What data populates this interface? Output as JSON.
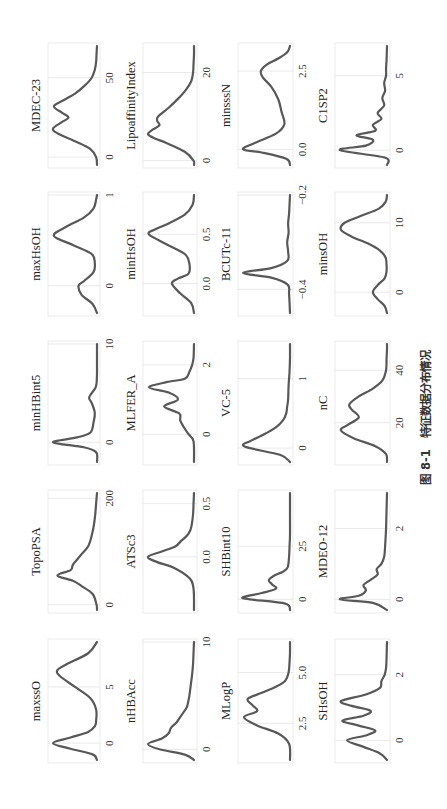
{
  "figure": {
    "caption": "图 8-1　特征数据分布情况",
    "orientation": "rotated 90° counter-clockwise",
    "colors": {
      "curve": "#585858",
      "grid": "#e3e3e3",
      "frame": "#e6e6e6"
    }
  },
  "chart_data": {
    "type": "line",
    "caption": "图 8-1　特征数据分布情况",
    "grid": true,
    "layout": {
      "rows": 5,
      "cols": 4
    },
    "panels": [
      {
        "row": 0,
        "col": 0,
        "name": "MDEC-23",
        "xticks": [
          0,
          50
        ],
        "xlim": [
          -5,
          70
        ],
        "x": [
          -5,
          0,
          5,
          10,
          15,
          18,
          22,
          25,
          28,
          32,
          36,
          40,
          45,
          50,
          55,
          60,
          65,
          70
        ],
        "y": [
          0,
          0.02,
          0.15,
          0.5,
          0.9,
          1.0,
          0.8,
          0.65,
          0.8,
          0.98,
          0.75,
          0.5,
          0.28,
          0.12,
          0.05,
          0.02,
          0.01,
          0
        ]
      },
      {
        "row": 0,
        "col": 1,
        "name": "LipoaffinityIndex",
        "xticks": [
          0,
          20
        ],
        "xlim": [
          -1,
          26
        ],
        "x": [
          -1,
          0,
          2,
          4,
          5,
          6,
          7,
          8,
          9,
          10,
          12,
          14,
          16,
          18,
          20,
          22,
          24,
          26
        ],
        "y": [
          0,
          0.01,
          0.2,
          0.6,
          0.85,
          1.0,
          0.9,
          0.75,
          0.8,
          0.78,
          0.55,
          0.35,
          0.18,
          0.06,
          0.02,
          0.01,
          0,
          0
        ]
      },
      {
        "row": 0,
        "col": 2,
        "name": "minsssN",
        "xticks": [
          0.0,
          2.5
        ],
        "xlim": [
          -0.5,
          3.3
        ],
        "x": [
          -0.5,
          -0.3,
          -0.1,
          0.0,
          0.2,
          0.5,
          0.8,
          1.2,
          1.6,
          2.0,
          2.3,
          2.5,
          2.7,
          2.9,
          3.1,
          3.3
        ],
        "y": [
          0,
          0.08,
          0.6,
          1.0,
          0.75,
          0.3,
          0.12,
          0.18,
          0.25,
          0.4,
          0.58,
          0.62,
          0.5,
          0.25,
          0.06,
          0
        ]
      },
      {
        "row": 0,
        "col": 3,
        "name": "C1SP2",
        "xticks": [
          0,
          5
        ],
        "xlim": [
          -1,
          7
        ],
        "x": [
          -1,
          -0.5,
          0,
          0.3,
          0.7,
          1,
          1.3,
          1.7,
          2.1,
          2.5,
          3,
          3.5,
          4,
          4.5,
          5,
          5.5,
          6,
          7
        ],
        "y": [
          0,
          0.05,
          1.0,
          0.45,
          0.3,
          0.65,
          0.25,
          0.3,
          0.12,
          0.2,
          0.06,
          0.1,
          0.04,
          0.06,
          0.02,
          0.02,
          0.01,
          0
        ]
      },
      {
        "row": 1,
        "col": 0,
        "name": "maxHsOH",
        "xticks": [
          0,
          1
        ],
        "xlim": [
          -0.3,
          1.0
        ],
        "x": [
          -0.3,
          -0.2,
          -0.1,
          0.0,
          0.05,
          0.15,
          0.25,
          0.35,
          0.45,
          0.55,
          0.65,
          0.75,
          0.85,
          0.95,
          1.0
        ],
        "y": [
          0,
          0.1,
          0.35,
          0.42,
          0.3,
          0.08,
          0.05,
          0.12,
          0.55,
          0.98,
          0.7,
          0.3,
          0.08,
          0.02,
          0
        ]
      },
      {
        "row": 1,
        "col": 1,
        "name": "minHsOH",
        "xticks": [
          0.0,
          0.5
        ],
        "xlim": [
          -0.3,
          0.9
        ],
        "x": [
          -0.3,
          -0.2,
          -0.1,
          0.0,
          0.05,
          0.1,
          0.2,
          0.3,
          0.4,
          0.5,
          0.55,
          0.6,
          0.7,
          0.8,
          0.9
        ],
        "y": [
          0,
          0.06,
          0.3,
          0.48,
          0.35,
          0.12,
          0.1,
          0.2,
          0.6,
          0.98,
          0.85,
          0.6,
          0.2,
          0.03,
          0
        ]
      },
      {
        "row": 1,
        "col": 2,
        "name": "BCUTc-11",
        "xticks": [
          -0.4,
          -0.2
        ],
        "xlim": [
          -0.45,
          -0.2
        ],
        "x": [
          -0.45,
          -0.41,
          -0.39,
          -0.375,
          -0.365,
          -0.355,
          -0.34,
          -0.32,
          -0.3,
          -0.28,
          -0.26,
          -0.24,
          -0.22,
          -0.2
        ],
        "y": [
          0,
          0.02,
          0.05,
          0.4,
          1.0,
          0.4,
          0.06,
          0.04,
          0.06,
          0.03,
          0.04,
          0.02,
          0.01,
          0
        ]
      },
      {
        "row": 1,
        "col": 3,
        "name": "minsOH",
        "xticks": [
          0,
          10
        ],
        "xlim": [
          -3,
          14
        ],
        "x": [
          -3,
          -2,
          -1,
          0,
          1,
          2,
          3,
          4,
          5,
          6,
          7,
          8,
          9,
          10,
          11,
          12,
          13,
          14
        ],
        "y": [
          0,
          0.05,
          0.2,
          0.3,
          0.2,
          0.05,
          0.01,
          0.01,
          0.03,
          0.15,
          0.4,
          0.75,
          0.98,
          0.9,
          0.55,
          0.18,
          0.03,
          0
        ]
      },
      {
        "row": 2,
        "col": 0,
        "name": "minHBint5",
        "xticks": [
          0,
          10
        ],
        "xlim": [
          -2,
          10
        ],
        "x": [
          -2,
          -1,
          -0.5,
          0,
          0.5,
          1,
          2,
          3,
          4,
          4.5,
          5,
          5.5,
          6,
          7,
          8,
          9,
          10
        ],
        "y": [
          0,
          0.02,
          0.3,
          1.0,
          0.45,
          0.15,
          0.08,
          0.05,
          0.12,
          0.18,
          0.12,
          0.04,
          0.01,
          0,
          0,
          0,
          0
        ]
      },
      {
        "row": 2,
        "col": 1,
        "name": "MLFER_A",
        "xticks": [
          0,
          2
        ],
        "xlim": [
          -0.8,
          2.6
        ],
        "x": [
          -0.8,
          -0.2,
          0,
          0.2,
          0.4,
          0.6,
          0.8,
          1.0,
          1.2,
          1.35,
          1.5,
          1.6,
          1.8,
          2.0,
          2.2,
          2.6
        ],
        "y": [
          0,
          0.01,
          0.12,
          0.22,
          0.3,
          0.32,
          0.65,
          0.35,
          0.55,
          0.98,
          0.6,
          0.2,
          0.1,
          0.04,
          0.01,
          0
        ]
      },
      {
        "row": 2,
        "col": 2,
        "name": "VC-5",
        "xticks": [
          0,
          1
        ],
        "xlim": [
          -0.2,
          1.5
        ],
        "x": [
          -0.2,
          -0.1,
          0,
          0.05,
          0.1,
          0.2,
          0.3,
          0.4,
          0.5,
          0.6,
          0.7,
          0.9,
          1.1,
          1.3,
          1.5
        ],
        "y": [
          0,
          0.2,
          0.85,
          1.0,
          0.85,
          0.55,
          0.3,
          0.15,
          0.08,
          0.06,
          0.04,
          0.03,
          0.01,
          0,
          0
        ]
      },
      {
        "row": 2,
        "col": 3,
        "name": "nC",
        "xticks": [
          20,
          40
        ],
        "xlim": [
          5,
          50
        ],
        "x": [
          5,
          8,
          11,
          14,
          17,
          19,
          22,
          25,
          27,
          30,
          33,
          36,
          40,
          44,
          48,
          50
        ],
        "y": [
          0,
          0.02,
          0.25,
          0.7,
          0.98,
          0.85,
          0.6,
          0.75,
          0.8,
          0.6,
          0.3,
          0.1,
          0.02,
          0.01,
          0,
          0
        ]
      },
      {
        "row": 3,
        "col": 0,
        "name": "TopoPSA",
        "xticks": [
          0,
          200
        ],
        "xlim": [
          -10,
          210
        ],
        "x": [
          -10,
          0,
          20,
          35,
          45,
          55,
          65,
          75,
          85,
          95,
          110,
          130,
          150,
          170,
          190,
          210
        ],
        "y": [
          0,
          0.01,
          0.1,
          0.35,
          0.55,
          0.9,
          0.6,
          0.55,
          0.45,
          0.35,
          0.2,
          0.12,
          0.07,
          0.04,
          0.02,
          0
        ]
      },
      {
        "row": 3,
        "col": 1,
        "name": "ATSc3",
        "xticks": [
          0.0,
          0.5
        ],
        "xlim": [
          -0.5,
          0.6
        ],
        "x": [
          -0.5,
          -0.3,
          -0.2,
          -0.1,
          -0.05,
          0.0,
          0.05,
          0.1,
          0.15,
          0.2,
          0.25,
          0.3,
          0.4,
          0.5,
          0.6
        ],
        "y": [
          0,
          0.01,
          0.1,
          0.45,
          0.8,
          1.0,
          0.7,
          0.4,
          0.28,
          0.15,
          0.08,
          0.05,
          0.02,
          0.01,
          0
        ]
      },
      {
        "row": 3,
        "col": 2,
        "name": "SHBint10",
        "xticks": [
          0,
          25
        ],
        "xlim": [
          -5,
          50
        ],
        "x": [
          -5,
          -2,
          0,
          1,
          3,
          5,
          7,
          9,
          11,
          13,
          15,
          20,
          25,
          30,
          40,
          50
        ],
        "y": [
          0,
          0.1,
          0.85,
          1.0,
          0.6,
          0.3,
          0.38,
          0.45,
          0.35,
          0.15,
          0.05,
          0.02,
          0.01,
          0,
          0,
          0
        ]
      },
      {
        "row": 3,
        "col": 3,
        "name": "MDEO-12",
        "xticks": [
          0,
          2
        ],
        "xlim": [
          -0.3,
          3
        ],
        "x": [
          -0.3,
          -0.1,
          0,
          0.1,
          0.25,
          0.4,
          0.55,
          0.7,
          0.85,
          1.0,
          1.2,
          1.5,
          2.0,
          2.5,
          3.0
        ],
        "y": [
          0,
          0.3,
          1.0,
          0.6,
          0.45,
          0.5,
          0.35,
          0.2,
          0.22,
          0.12,
          0.06,
          0.04,
          0.02,
          0.01,
          0
        ]
      },
      {
        "row": 4,
        "col": 0,
        "name": "maxssO",
        "xticks": [
          0,
          5
        ],
        "xlim": [
          -1.5,
          9
        ],
        "x": [
          -1.5,
          -1,
          -0.5,
          0,
          0.5,
          1,
          1.5,
          2,
          3,
          4,
          5,
          6,
          6.5,
          7,
          8,
          9
        ],
        "y": [
          0,
          0.1,
          0.6,
          1.0,
          0.6,
          0.2,
          0.05,
          0.02,
          0.02,
          0.15,
          0.5,
          0.85,
          0.9,
          0.7,
          0.2,
          0
        ]
      },
      {
        "row": 4,
        "col": 1,
        "name": "nHBAcc",
        "xticks": [
          0,
          10
        ],
        "xlim": [
          -1,
          10
        ],
        "x": [
          -1,
          -0.5,
          0,
          0.5,
          1,
          1.5,
          2,
          2.5,
          3,
          3.5,
          4,
          5,
          6,
          7,
          8,
          9,
          10
        ],
        "y": [
          0,
          0.2,
          0.75,
          1.0,
          0.7,
          0.55,
          0.5,
          0.38,
          0.3,
          0.22,
          0.15,
          0.1,
          0.07,
          0.04,
          0.02,
          0.01,
          0
        ]
      },
      {
        "row": 4,
        "col": 2,
        "name": "MLogP",
        "xticks": [
          2.5,
          5.0
        ],
        "xlim": [
          0.7,
          6.5
        ],
        "x": [
          0.7,
          1.5,
          2.0,
          2.4,
          2.8,
          3.1,
          3.4,
          3.7,
          4.0,
          4.3,
          4.6,
          5.0,
          5.5,
          6.0,
          6.5
        ],
        "y": [
          0,
          0.02,
          0.25,
          0.7,
          0.98,
          0.7,
          0.8,
          0.9,
          0.6,
          0.3,
          0.1,
          0.03,
          0.01,
          0,
          0
        ]
      },
      {
        "row": 4,
        "col": 3,
        "name": "SHsOH",
        "xticks": [
          0,
          2
        ],
        "xlim": [
          -0.6,
          3
        ],
        "x": [
          -0.6,
          -0.4,
          -0.2,
          0,
          0.15,
          0.3,
          0.45,
          0.6,
          0.75,
          0.9,
          1.05,
          1.2,
          1.4,
          1.6,
          1.8,
          2.0,
          2.2,
          2.5,
          3.0
        ],
        "y": [
          0,
          0.15,
          0.5,
          0.85,
          0.45,
          0.25,
          0.6,
          0.95,
          0.5,
          0.35,
          0.75,
          0.98,
          0.45,
          0.15,
          0.12,
          0.05,
          0.02,
          0.01,
          0
        ]
      }
    ]
  }
}
